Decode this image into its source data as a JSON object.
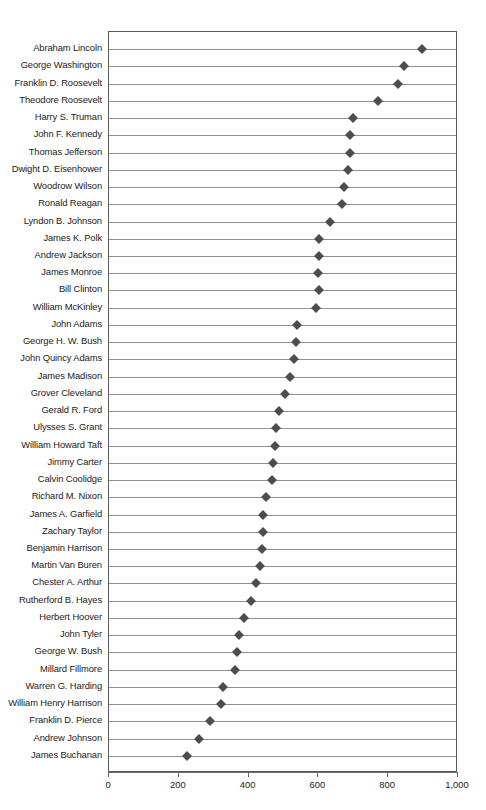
{
  "chart_data": {
    "type": "scatter",
    "title": "",
    "subtitle": "",
    "xlabel": "",
    "ylabel": "",
    "xlim": [
      0,
      1000
    ],
    "xticks": [
      0,
      200,
      400,
      600,
      800,
      1000
    ],
    "xtick_labels": [
      "0",
      "200",
      "400",
      "600",
      "800",
      "1,000"
    ],
    "grid": "horizontal",
    "legend": "none",
    "orientation": "horizontal",
    "marker": "diamond",
    "marker_color": "#4d4d4d",
    "categories": [
      "Abraham Lincoln",
      "George Washington",
      "Franklin D. Roosevelt",
      "Theodore Roosevelt",
      "Harry S. Truman",
      "John F. Kennedy",
      "Thomas Jefferson",
      "Dwight D. Eisenhower",
      "Woodrow Wilson",
      "Ronald Reagan",
      "Lyndon B. Johnson",
      "James K. Polk",
      "Andrew Jackson",
      "James Monroe",
      "Bill Clinton",
      "William McKinley",
      "John Adams",
      "George H. W. Bush",
      "John Quincy Adams",
      "James Madison",
      "Grover Cleveland",
      "Gerald R. Ford",
      "Ulysses S. Grant",
      "William Howard Taft",
      "Jimmy Carter",
      "Calvin Coolidge",
      "Richard M. Nixon",
      "James A. Garfield",
      "Zachary Taylor",
      "Benjamin Harrison",
      "Martin Van Buren",
      "Chester A. Arthur",
      "Rutherford B. Hayes",
      "Herbert Hoover",
      "John Tyler",
      "George W. Bush",
      "Millard Fillmore",
      "Warren G. Harding",
      "William Henry Harrison",
      "Franklin D. Pierce",
      "Andrew Johnson",
      "James Buchanan"
    ],
    "values": [
      897,
      845,
      828,
      771,
      700,
      691,
      691,
      685,
      673,
      668,
      633,
      602,
      602,
      599,
      602,
      593,
      539,
      536,
      530,
      519,
      504,
      487,
      479,
      476,
      470,
      467,
      450,
      441,
      441,
      438,
      433,
      421,
      407,
      387,
      373,
      367,
      361,
      327,
      321,
      289,
      258,
      224
    ]
  },
  "axis": {
    "x_min_label": "0",
    "x_max_label": "1,000"
  }
}
